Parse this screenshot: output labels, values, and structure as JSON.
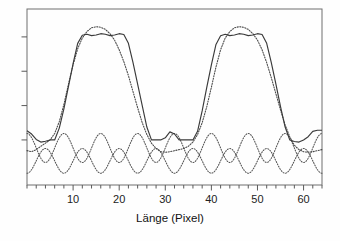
{
  "chart_data": {
    "type": "line",
    "title": "",
    "xlabel": "Länge (Pixel)",
    "ylabel": "",
    "xlim": [
      0,
      64
    ],
    "ylim": [
      -0.42,
      1.22
    ],
    "grid": false,
    "legend": "none",
    "x_ticks_major": [
      10,
      20,
      30,
      40,
      50,
      60
    ],
    "x_tick_labels": [
      "10",
      "20",
      "30",
      "40",
      "50",
      "60"
    ],
    "x_ticks_minor_step": 2,
    "y_ticks": [
      0.0,
      0.32,
      0.64,
      0.96
    ],
    "y_tick_labels": [
      "",
      "",
      "",
      ""
    ],
    "series": [
      {
        "name": "solid-reconstruction",
        "style": "solid",
        "color": "#3a3a3a",
        "x": [
          0,
          1,
          2,
          3,
          4,
          5,
          6,
          7,
          8,
          9,
          10,
          11,
          12,
          13,
          14,
          15,
          16,
          17,
          18,
          19,
          20,
          21,
          22,
          23,
          24,
          25,
          26,
          27,
          28,
          29,
          30,
          31,
          32,
          33,
          34,
          35,
          36,
          37,
          38,
          39,
          40,
          41,
          42,
          43,
          44,
          45,
          46,
          47,
          48,
          49,
          50,
          51,
          52,
          53,
          54,
          55,
          56,
          57,
          58,
          59,
          60,
          61,
          62,
          63,
          64
        ],
        "y": [
          0.085,
          0.055,
          0.005,
          -0.02,
          -0.012,
          0.0,
          0.0,
          0.11,
          0.29,
          0.5,
          0.71,
          0.9,
          0.975,
          0.985,
          0.972,
          0.978,
          0.99,
          0.985,
          0.972,
          0.978,
          0.99,
          0.982,
          0.9,
          0.72,
          0.52,
          0.32,
          0.12,
          0.0,
          0.0,
          0.0,
          0.02,
          0.075,
          0.055,
          0.0,
          0.0,
          0.0,
          0.0,
          0.08,
          0.27,
          0.49,
          0.7,
          0.89,
          0.97,
          0.985,
          0.972,
          0.978,
          0.99,
          0.985,
          0.972,
          0.978,
          0.99,
          0.982,
          0.9,
          0.72,
          0.52,
          0.31,
          0.12,
          0.0,
          -0.015,
          -0.02,
          0.0,
          0.03,
          0.08,
          0.09,
          0.09
        ]
      },
      {
        "name": "dotted-overshoot",
        "style": "dotted",
        "color": "#4a4a4a",
        "x": [
          0,
          1,
          2,
          3,
          4,
          5,
          6,
          7,
          8,
          9,
          10,
          11,
          12,
          13,
          14,
          15,
          16,
          17,
          18,
          19,
          20,
          21,
          22,
          23,
          24,
          25,
          26,
          27,
          28,
          29,
          30,
          31,
          32,
          33,
          34,
          35,
          36,
          37,
          38,
          39,
          40,
          41,
          42,
          43,
          44,
          45,
          46,
          47,
          48,
          49,
          50,
          51,
          52,
          53,
          54,
          55,
          56,
          57,
          58,
          59,
          60,
          61,
          62,
          63,
          64
        ],
        "y": [
          -0.1,
          -0.11,
          -0.09,
          -0.06,
          -0.03,
          0.0,
          0.06,
          0.17,
          0.33,
          0.52,
          0.7,
          0.85,
          0.95,
          1.01,
          1.045,
          1.055,
          1.05,
          1.03,
          0.99,
          0.93,
          0.84,
          0.73,
          0.6,
          0.45,
          0.3,
          0.16,
          0.05,
          -0.03,
          -0.08,
          -0.11,
          -0.115,
          -0.11,
          -0.1,
          -0.09,
          -0.08,
          -0.06,
          -0.02,
          0.05,
          0.16,
          0.31,
          0.49,
          0.68,
          0.84,
          0.95,
          1.01,
          1.045,
          1.055,
          1.05,
          1.03,
          0.99,
          0.93,
          0.84,
          0.72,
          0.58,
          0.43,
          0.28,
          0.14,
          0.03,
          -0.05,
          -0.09,
          -0.11,
          -0.115,
          -0.11,
          -0.1,
          -0.09
        ]
      },
      {
        "name": "dotted-ripple-upper",
        "style": "dotted",
        "color": "#555555",
        "description": "low-amplitude oscillation above baseline",
        "period": 8.0,
        "amplitude": 0.135,
        "offset": -0.075
      },
      {
        "name": "dotted-ripple-lower",
        "style": "dotted",
        "color": "#555555",
        "description": "low-amplitude oscillation below baseline, phase shifted",
        "period": 8.0,
        "amplitude": 0.115,
        "offset": -0.195
      }
    ]
  },
  "axes": {
    "x_axis_label": "Länge (Pixel)",
    "frame_color": "#6f6f6f",
    "tick_color": "#5a5a5a"
  }
}
